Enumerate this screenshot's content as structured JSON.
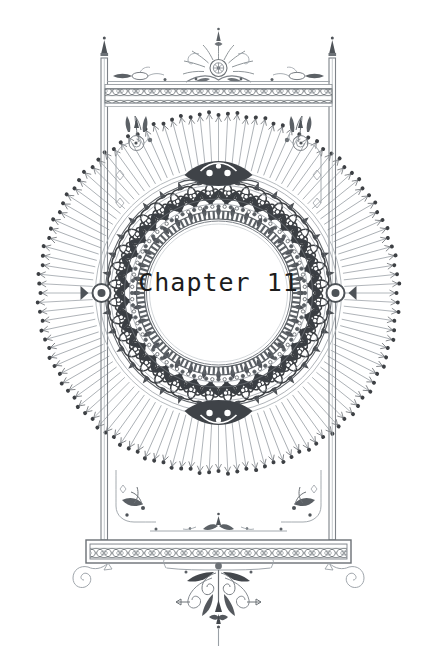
{
  "page": {
    "kind": "ornamental-chapter-heading",
    "background_color": "#ffffff",
    "width": 437,
    "height": 651
  },
  "heading": {
    "text": "Chapter 11",
    "chapter_word": "Chapter",
    "chapter_number": "11",
    "color": "#1c1c1c"
  },
  "ornament": {
    "ink_color": "#5f6368",
    "ink_dark": "#3d4044",
    "ink_light": "#9aa0a6",
    "ink_pale": "#b8bdc2",
    "frame_label": "rectangular-frame",
    "top_crest_label": "palmette-crest",
    "top_band_label": "guilloche-band",
    "bottom_band_label": "guilloche-band",
    "pendant_label": "scrollwork-pendant",
    "medallion_label": "foliate-circular-medallion",
    "sunburst_label": "radiating-pin-rays",
    "finial_label": "post-finial",
    "corner_label": "corner-floret",
    "volute_label": "spiral-volute",
    "ray_count": 120,
    "band_pattern": "interlocking-ovals"
  }
}
